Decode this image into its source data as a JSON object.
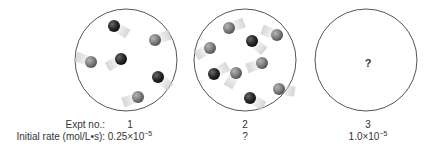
{
  "labels": {
    "expt_no": "Expt no.:",
    "initial_rate": "Initial rate (mol/L•s):"
  },
  "experiments": [
    {
      "number": "1",
      "rate_mantissa": "0.25×10",
      "rate_exponent": "−5",
      "balls": [
        {
          "x": 114,
          "y": 26,
          "type": "dark"
        },
        {
          "x": 155,
          "y": 40,
          "type": "gray"
        },
        {
          "x": 91,
          "y": 62,
          "type": "gray"
        },
        {
          "x": 121,
          "y": 59,
          "type": "dark"
        },
        {
          "x": 158,
          "y": 77,
          "type": "dark"
        },
        {
          "x": 138,
          "y": 97,
          "type": "gray"
        }
      ]
    },
    {
      "number": "2",
      "rate_text": "?",
      "balls": [
        {
          "x": 229,
          "y": 28,
          "type": "gray"
        },
        {
          "x": 277,
          "y": 35,
          "type": "gray"
        },
        {
          "x": 210,
          "y": 48,
          "type": "gray"
        },
        {
          "x": 252,
          "y": 41,
          "type": "dark"
        },
        {
          "x": 262,
          "y": 63,
          "type": "gray"
        },
        {
          "x": 214,
          "y": 74,
          "type": "dark"
        },
        {
          "x": 236,
          "y": 73,
          "type": "gray"
        },
        {
          "x": 279,
          "y": 89,
          "type": "gray"
        },
        {
          "x": 250,
          "y": 98,
          "type": "dark"
        }
      ]
    },
    {
      "number": "3",
      "rate_mantissa": "1.0×10",
      "rate_exponent": "−5",
      "contents": "?"
    }
  ],
  "colors": {
    "dark_ball": "#2a2a2a",
    "gray_ball": "#7f7f7f",
    "circle_stroke": "#555555"
  }
}
